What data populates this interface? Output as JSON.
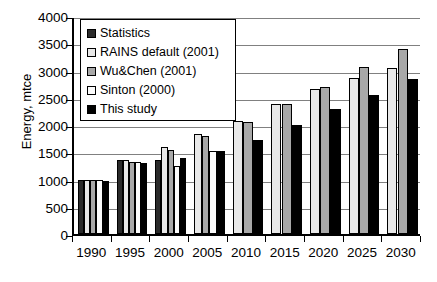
{
  "chart_data": {
    "type": "bar",
    "title": "",
    "xlabel": "",
    "ylabel": "Energy, mtce",
    "ylim": [
      0,
      4000
    ],
    "ytick_step": 500,
    "yticks": [
      "4000",
      "3500",
      "3000",
      "2500",
      "2000",
      "1500",
      "1000",
      "500",
      "0"
    ],
    "grid": true,
    "legend_position": "upper-left-inside",
    "categories": [
      "1990",
      "1995",
      "2000",
      "2005",
      "2010",
      "2015",
      "2020",
      "2025",
      "2030"
    ],
    "series": [
      {
        "name": "Statistics",
        "color": "#2b2b2b",
        "values": [
          1000,
          1350,
          1350,
          null,
          null,
          null,
          null,
          null,
          null
        ]
      },
      {
        "name": "RAINS default (2001)",
        "color": "#e8e8e8",
        "values": [
          1000,
          1350,
          1600,
          1830,
          2080,
          2390,
          2670,
          2870,
          3050
        ]
      },
      {
        "name": "Wu&Chen (2001)",
        "color": "#a8a8a8",
        "values": [
          1000,
          1330,
          1550,
          1800,
          2050,
          2390,
          2700,
          3070,
          3400
        ]
      },
      {
        "name": "Sinton (2000)",
        "color": "#fbfbfb",
        "values": [
          1000,
          1330,
          1250,
          1520,
          null,
          null,
          null,
          null,
          null
        ]
      },
      {
        "name": "This study",
        "color": "#000000",
        "values": [
          980,
          1300,
          1400,
          1530,
          1730,
          2000,
          2300,
          2550,
          2850
        ]
      }
    ]
  },
  "legend": {
    "items": [
      {
        "label": "Statistics",
        "swatch": "#2b2b2b"
      },
      {
        "label": "RAINS default (2001)",
        "swatch": "#e8e8e8"
      },
      {
        "label": "Wu&Chen (2001)",
        "swatch": "#a8a8a8"
      },
      {
        "label": "Sinton (2000)",
        "swatch": "#fbfbfb"
      },
      {
        "label": "This study",
        "swatch": "#000000"
      }
    ]
  }
}
